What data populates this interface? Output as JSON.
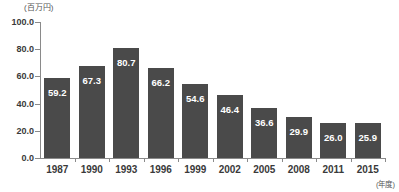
{
  "chart_data": {
    "type": "bar",
    "title": "",
    "subtitle": "",
    "unit_label": "(百万円)",
    "xlabel": "(年度)",
    "ylabel": "",
    "categories": [
      "1987",
      "1990",
      "1993",
      "1996",
      "1999",
      "2002",
      "2005",
      "2008",
      "2011",
      "2015"
    ],
    "values": [
      59.2,
      67.3,
      80.7,
      66.2,
      54.6,
      46.4,
      36.6,
      29.9,
      26.0,
      25.9
    ],
    "value_labels": [
      "59.2",
      "67.3",
      "80.7",
      "66.2",
      "54.6",
      "46.4",
      "36.6",
      "29.9",
      "26.0",
      "25.9"
    ],
    "ylim": [
      0.0,
      100.0
    ],
    "ytick_values": [
      0.0,
      20.0,
      40.0,
      60.0,
      80.0,
      100.0
    ],
    "ytick_labels": [
      "0.0",
      "20.0",
      "40.0",
      "60.0",
      "80.0",
      "100.0"
    ],
    "grid": false,
    "legend": false,
    "legend_position": "none",
    "bar_color": "#4a4a4a",
    "value_label_color": "#ffffff",
    "axis_color": "#8a8a8a",
    "background_color": "#ffffff"
  }
}
